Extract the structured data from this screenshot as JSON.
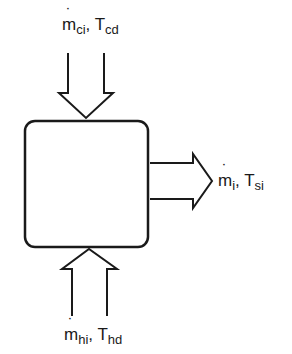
{
  "diagram": {
    "type": "control-volume mass/energy flow diagram",
    "box": {
      "label": "",
      "shape": "rounded-rectangle"
    },
    "inputs": [
      {
        "id": "top",
        "direction": "down-into-box",
        "symbol": "m",
        "symbol_subscript": "ci",
        "temp_symbol": "T",
        "temp_subscript": "cd",
        "separator": ","
      },
      {
        "id": "bottom",
        "direction": "up-into-box",
        "symbol": "m",
        "symbol_subscript": "hi",
        "temp_symbol": "T",
        "temp_subscript": "hd",
        "separator": ","
      }
    ],
    "outputs": [
      {
        "id": "right",
        "direction": "right-out-of-box",
        "symbol": "m",
        "symbol_subscript": "i",
        "temp_symbol": "T",
        "temp_subscript": "si",
        "separator": ","
      }
    ],
    "colors": {
      "stroke": "#1a1a1a",
      "background": "#ffffff"
    }
  }
}
